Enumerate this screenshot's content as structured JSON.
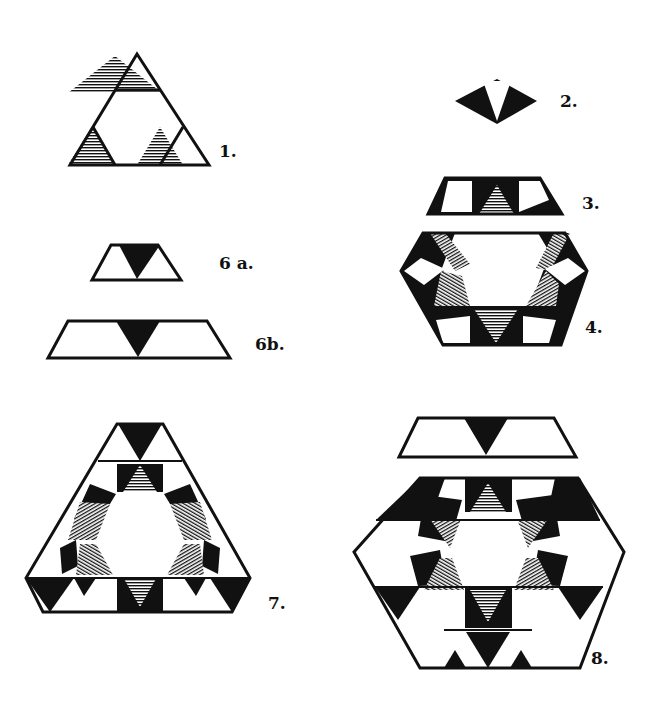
{
  "colors": {
    "ink": "#111111",
    "paper": "#ffffff"
  },
  "figures": [
    {
      "id": "1",
      "label": "1."
    },
    {
      "id": "2",
      "label": "2."
    },
    {
      "id": "3",
      "label": "3."
    },
    {
      "id": "4",
      "label": "4."
    },
    {
      "id": "6a",
      "label": "6 a."
    },
    {
      "id": "6b",
      "label": "6b."
    },
    {
      "id": "7",
      "label": "7."
    },
    {
      "id": "8",
      "label": "8."
    }
  ]
}
